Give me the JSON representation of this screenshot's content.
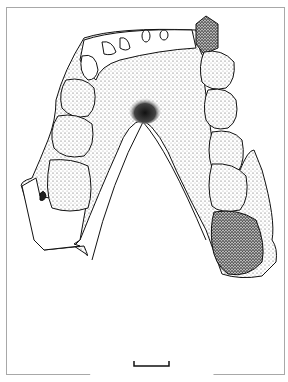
{
  "figure": {
    "caption": "",
    "scale_bar": {
      "label": "",
      "x1": 134,
      "x2": 169,
      "y": 366
    },
    "colors": {
      "ink": "#111111",
      "frame": "#a8a8a8",
      "paper": "#ffffff",
      "stipple": "#333333"
    }
  }
}
